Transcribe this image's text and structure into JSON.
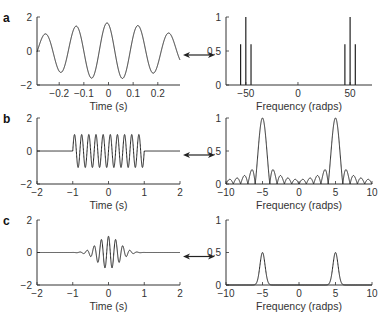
{
  "figure": {
    "panels": [
      {
        "letter": "a",
        "time_xlabel": "Time (s)",
        "freq_xlabel": "Frequency (radps)"
      },
      {
        "letter": "b",
        "time_xlabel": "Time (s)",
        "freq_xlabel": "Frequency (radps)"
      },
      {
        "letter": "c",
        "time_xlabel": "Time (s)",
        "freq_xlabel": "Frequency (radps)"
      }
    ],
    "arrow_icon": "double-headed-arrow"
  },
  "chart_data": [
    {
      "panel": "a-time",
      "type": "line",
      "title": "",
      "xlabel": "Time (s)",
      "ylabel": "",
      "xlim": [
        -0.29,
        0.29
      ],
      "ylim": [
        -2,
        2
      ],
      "xticks": [
        -0.2,
        -0.1,
        0,
        0.1,
        0.2
      ],
      "yticks": [
        -2,
        0,
        2
      ],
      "xtick_labels": [
        "−0.2",
        "−0.1",
        "0",
        "0.1",
        "0.2"
      ],
      "ytick_labels": [
        "−2",
        "0",
        "2"
      ],
      "description": "Beating signal: carrier ~50 rad/s with amplitude modulation (sum of cos at 45, 50, 55 rad/s); envelope peaks ≈1.6 at t≈-0.25,-0.05,0.15",
      "components": [
        {
          "freq": 45,
          "amp": 0.6
        },
        {
          "freq": 50,
          "amp": 1.0
        },
        {
          "freq": 55,
          "amp": 0.6
        }
      ]
    },
    {
      "panel": "a-freq",
      "type": "bar",
      "xlabel": "Frequency (radps)",
      "ylabel": "",
      "xlim": [
        -69,
        71
      ],
      "ylim": [
        0,
        1
      ],
      "xticks": [
        -50,
        0,
        50
      ],
      "yticks": [
        0,
        0.5,
        1
      ],
      "xtick_labels": [
        "−50",
        "0",
        "50"
      ],
      "ytick_labels": [
        "0",
        "0.5",
        "1"
      ],
      "x": [
        -55,
        -50,
        -45,
        45,
        50,
        55
      ],
      "values": [
        0.6,
        1.0,
        0.6,
        0.6,
        1.0,
        0.6
      ]
    },
    {
      "panel": "b-time",
      "type": "line",
      "xlabel": "Time (s)",
      "ylabel": "",
      "xlim": [
        -2,
        2
      ],
      "ylim": [
        -2,
        2
      ],
      "xticks": [
        -2,
        -1,
        0,
        1,
        2
      ],
      "yticks": [
        -2,
        0,
        2
      ],
      "xtick_labels": [
        "−2",
        "−1",
        "0",
        "1",
        "2"
      ],
      "ytick_labels": [
        "−2",
        "0",
        "2"
      ],
      "description": "Rectangular-windowed sinusoid, amplitude 1, ~10 cycles between t=-1 and t=1, zero elsewhere",
      "window": [
        -1,
        1
      ],
      "amplitude": 1,
      "freq_radps": 5
    },
    {
      "panel": "b-freq",
      "type": "line",
      "xlabel": "Frequency (radps)",
      "ylabel": "",
      "xlim": [
        -10,
        10
      ],
      "ylim": [
        0,
        1
      ],
      "xticks": [
        -10,
        -5,
        0,
        5,
        10
      ],
      "yticks": [
        0,
        0.5,
        1
      ],
      "xtick_labels": [
        "−10",
        "−5",
        "0",
        "5",
        "10"
      ],
      "ytick_labels": [
        "0",
        "0.5",
        "1"
      ],
      "description": "|sinc| spectra centered at ±5 rad/s with peak 1 and decaying sidelobes",
      "peaks": [
        {
          "x": -5,
          "y": 1.0
        },
        {
          "x": 5,
          "y": 1.0
        }
      ]
    },
    {
      "panel": "c-time",
      "type": "line",
      "xlabel": "Time (s)",
      "ylabel": "",
      "xlim": [
        -2,
        2
      ],
      "ylim": [
        -2,
        2
      ],
      "xticks": [
        -2,
        -1,
        0,
        1,
        2
      ],
      "yticks": [
        -2,
        0,
        2
      ],
      "xtick_labels": [
        "−2",
        "−1",
        "0",
        "1",
        "2"
      ],
      "ytick_labels": [
        "−2",
        "0",
        "2"
      ],
      "description": "Gaussian-windowed sinusoid, peak amplitude ≈1 at t=0, decaying to ~0 by |t|≈1",
      "amplitude": 1,
      "freq_radps": 5
    },
    {
      "panel": "c-freq",
      "type": "line",
      "xlabel": "Frequency (radps)",
      "ylabel": "",
      "xlim": [
        -10,
        10
      ],
      "ylim": [
        0,
        1
      ],
      "xticks": [
        -10,
        -5,
        0,
        5,
        10
      ],
      "yticks": [
        0,
        0.5,
        1
      ],
      "xtick_labels": [
        "−10",
        "−5",
        "0",
        "5",
        "10"
      ],
      "ytick_labels": [
        "0",
        "0.5",
        "1"
      ],
      "description": "Gaussian spectra centered at ±5 rad/s with peak ≈0.5, no sidelobes",
      "peaks": [
        {
          "x": -5,
          "y": 0.5
        },
        {
          "x": 5,
          "y": 0.5
        }
      ]
    }
  ]
}
